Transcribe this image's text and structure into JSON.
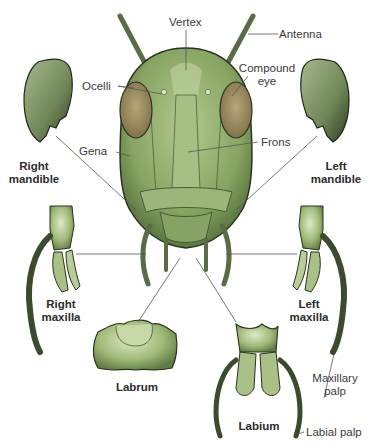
{
  "diagram": {
    "colors": {
      "body": "#8fae6b",
      "body_dark": "#4f6b3a",
      "body_light": "#b8cf98",
      "eye": "#9c8d62",
      "outline": "#2a3320",
      "leader": "#555555",
      "text": "#3a3a3a",
      "background": "#ffffff"
    },
    "labels": {
      "vertex": "Vertex",
      "antenna": "Antenna",
      "ocelli": "Ocelli",
      "compound_eye_1": "Compound",
      "compound_eye_2": "eye",
      "gena": "Gena",
      "frons": "Frons",
      "right_mandible_1": "Right",
      "right_mandible_2": "mandible",
      "left_mandible_1": "Left",
      "left_mandible_2": "mandible",
      "right_maxilla_1": "Right",
      "right_maxilla_2": "maxilla",
      "left_maxilla_1": "Left",
      "left_maxilla_2": "maxilla",
      "labrum": "Labrum",
      "labium": "Labium",
      "maxillary_palp_1": "Maxillary",
      "maxillary_palp_2": "palp",
      "labial_palp": "Labial palp"
    }
  }
}
